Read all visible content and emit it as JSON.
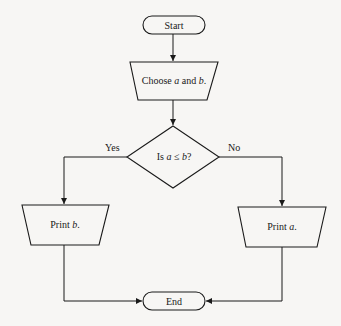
{
  "diagram": {
    "type": "flowchart",
    "nodes": {
      "start": {
        "shape": "terminator",
        "label": "Start"
      },
      "choose": {
        "shape": "manual-input-trapezoid",
        "label_parts": [
          "Choose ",
          "a",
          " and ",
          "b",
          "."
        ]
      },
      "decision": {
        "shape": "diamond",
        "label_parts": [
          "Is ",
          "a",
          " ≤ ",
          "b",
          "?"
        ]
      },
      "print_b": {
        "shape": "manual-input-trapezoid",
        "label_parts": [
          "Print ",
          "b",
          "."
        ]
      },
      "print_a": {
        "shape": "manual-input-trapezoid",
        "label_parts": [
          "Print ",
          "a",
          "."
        ]
      },
      "end": {
        "shape": "terminator",
        "label": "End"
      }
    },
    "edges": {
      "yes_label": "Yes",
      "no_label": "No"
    },
    "connections": [
      {
        "from": "Start",
        "to": "Choose a and b."
      },
      {
        "from": "Choose a and b.",
        "to": "Is a ≤ b?"
      },
      {
        "from": "Is a ≤ b?",
        "to": "Print b.",
        "label": "Yes"
      },
      {
        "from": "Is a ≤ b?",
        "to": "Print a.",
        "label": "No"
      },
      {
        "from": "Print b.",
        "to": "End"
      },
      {
        "from": "Print a.",
        "to": "End"
      }
    ]
  }
}
